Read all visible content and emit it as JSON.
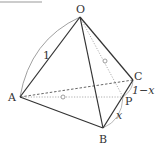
{
  "figure": {
    "type": "tetrahedron",
    "colors": {
      "solid_edge": "#333333",
      "hidden_edge": "#555555",
      "construction": "#999999",
      "arc": "#888888",
      "frame": "#bbbbbb"
    },
    "vertices": {
      "O": {
        "label": "O",
        "x": 80,
        "y": 17
      },
      "A": {
        "label": "A",
        "x": 20,
        "y": 97
      },
      "B": {
        "label": "B",
        "x": 103,
        "y": 128
      },
      "C": {
        "label": "C",
        "x": 133,
        "y": 80
      },
      "P": {
        "label": "P",
        "x": 123,
        "y": 97
      }
    },
    "labels": {
      "O": "O",
      "A": "A",
      "B": "B",
      "C": "C",
      "P": "P",
      "edge_length": "1",
      "BP": "x",
      "PC": "1−x"
    },
    "edges": {
      "solid": [
        "OA",
        "OB",
        "OC",
        "AB",
        "BC"
      ],
      "dashed": [
        "AC"
      ],
      "dotted": [
        "AP",
        "OP"
      ]
    },
    "equal_marks": [
      "AP",
      "OP"
    ]
  }
}
